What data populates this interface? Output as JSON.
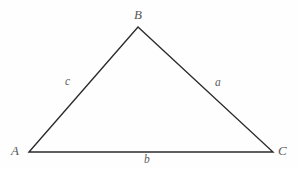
{
  "figure": {
    "background_color": "#fefefe",
    "stroke_color": "#2b2b2b",
    "label_color": "#575757",
    "width": 297,
    "height": 169,
    "vertices": [
      {
        "name": "A",
        "label": "A",
        "x": 29,
        "y": 152,
        "label_x": 16,
        "label_y": 151
      },
      {
        "name": "B",
        "label": "B",
        "x": 138,
        "y": 27,
        "label_x": 140,
        "label_y": 15
      },
      {
        "name": "C",
        "label": "C",
        "x": 273,
        "y": 152,
        "label_x": 284,
        "label_y": 151
      }
    ],
    "sides": [
      {
        "name": "side-c",
        "label": "c",
        "from": "A",
        "to": "B",
        "label_x": 68,
        "label_y": 82
      },
      {
        "name": "side-a",
        "label": "a",
        "from": "B",
        "to": "C",
        "label_x": 219,
        "label_y": 83
      },
      {
        "name": "side-b",
        "label": "b",
        "from": "A",
        "to": "C",
        "label_x": 147,
        "label_y": 160
      }
    ],
    "polygon_points": "29,152 138,27 273,152"
  }
}
